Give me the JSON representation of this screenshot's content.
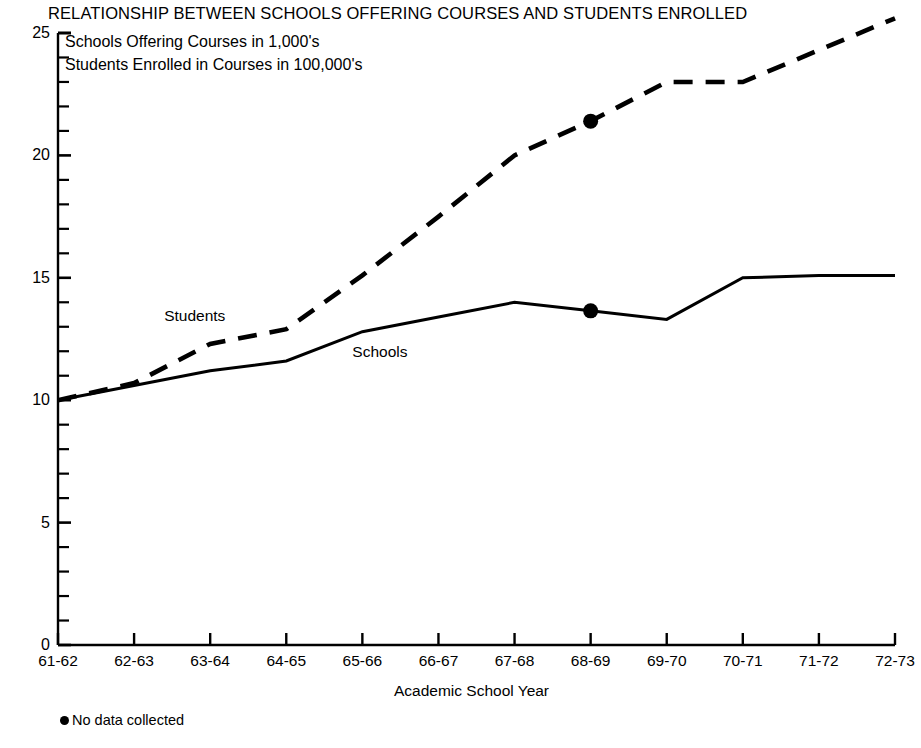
{
  "chart_data": {
    "type": "line",
    "title": "RELATIONSHIP BETWEEN SCHOOLS OFFERING COURSES AND STUDENTS ENROLLED",
    "subtitle_lines": [
      "Schools Offering Courses in 1,000's",
      "Students Enrolled in Courses in 100,000's"
    ],
    "xlabel": "Academic School Year",
    "ylabel": "",
    "categories": [
      "61-62",
      "62-63",
      "63-64",
      "64-65",
      "65-66",
      "66-67",
      "67-68",
      "68-69",
      "69-70",
      "70-71",
      "71-72",
      "72-73"
    ],
    "ylim": [
      0,
      25
    ],
    "yticks": [
      0,
      5,
      10,
      15,
      20,
      25
    ],
    "yticks_minor_step": 1,
    "grid": false,
    "legend_position": "inline",
    "series": [
      {
        "name": "Schools",
        "style": "solid",
        "label_x_category": "65-66",
        "values": [
          10.0,
          10.6,
          11.2,
          11.6,
          12.8,
          13.4,
          14.0,
          13.65,
          13.3,
          15.0,
          15.1,
          15.1
        ]
      },
      {
        "name": "Students",
        "style": "dashed",
        "label_x_category": "63-64",
        "values": [
          10.0,
          10.7,
          12.3,
          12.9,
          15.1,
          17.5,
          20.0,
          21.4,
          23.0,
          23.0,
          24.3,
          25.6
        ]
      }
    ],
    "annotations": [
      {
        "text": "No data collected",
        "marker": "filled-circle",
        "applies_to_category": "68-69"
      }
    ],
    "markers": [
      {
        "series": "Students",
        "category": "68-69",
        "value": 21.4
      },
      {
        "series": "Schools",
        "category": "68-69",
        "value": 13.65
      }
    ],
    "colors": {
      "line": "#000000",
      "background": "#ffffff",
      "text": "#000000"
    }
  }
}
